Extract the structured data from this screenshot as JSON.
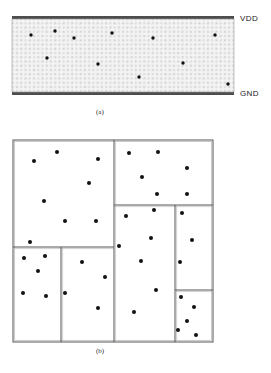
{
  "page": {
    "background_color": "#ffffff",
    "width": 271,
    "height": 373
  },
  "figure_a": {
    "caption": "(a)",
    "labels": {
      "top_rail": "VDD",
      "bottom_rail": "GND"
    },
    "region": {
      "x": 12,
      "y": 19,
      "width": 222,
      "height": 73,
      "fill_color": "#f2f2f2",
      "hatch_color": "#c9c9c9",
      "rail_color": "#4d4d4d",
      "rail_thickness": 3
    },
    "dot_color": "#111111",
    "dot_radius": 1.7,
    "dots": [
      {
        "x": 31,
        "y": 35
      },
      {
        "x": 55,
        "y": 31
      },
      {
        "x": 74,
        "y": 38
      },
      {
        "x": 112,
        "y": 33
      },
      {
        "x": 153,
        "y": 38
      },
      {
        "x": 215,
        "y": 35
      },
      {
        "x": 47,
        "y": 58
      },
      {
        "x": 98,
        "y": 64
      },
      {
        "x": 183,
        "y": 63
      },
      {
        "x": 139,
        "y": 77
      },
      {
        "x": 228,
        "y": 84
      }
    ]
  },
  "figure_b": {
    "caption": "(b)",
    "outline": {
      "x": 13,
      "y": 140,
      "width": 200,
      "height": 202,
      "stroke_color": "#555555",
      "stroke_width": 1
    },
    "partitions": [
      {
        "name": "top-left-block",
        "x": 13,
        "y": 140,
        "width": 101,
        "height": 107
      },
      {
        "name": "top-right-block",
        "x": 114,
        "y": 140,
        "width": 99,
        "height": 65
      },
      {
        "name": "center-l-block",
        "x": 13,
        "y": 247,
        "width": 162,
        "height": 95
      },
      {
        "name": "middle-center-block",
        "x": 114,
        "y": 205,
        "width": 61,
        "height": 137
      },
      {
        "name": "right-upper-block",
        "x": 175,
        "y": 205,
        "width": 38,
        "height": 85
      },
      {
        "name": "right-lower-block",
        "x": 175,
        "y": 290,
        "width": 38,
        "height": 52
      },
      {
        "name": "bottom-left-block",
        "x": 13,
        "y": 247,
        "width": 48,
        "height": 95
      }
    ],
    "dividers": [
      {
        "name": "divider-top-vertical",
        "x1": 114,
        "y1": 140,
        "x2": 114,
        "y2": 205
      },
      {
        "name": "divider-upper-horizontal",
        "x1": 114,
        "y1": 205,
        "x2": 213,
        "y2": 205
      },
      {
        "name": "divider-center-vertical",
        "x1": 114,
        "y1": 205,
        "x2": 114,
        "y2": 247
      },
      {
        "name": "divider-left-horizontal",
        "x1": 13,
        "y1": 247,
        "x2": 114,
        "y2": 247
      },
      {
        "name": "divider-center-vertical-2",
        "x1": 175,
        "y1": 205,
        "x2": 175,
        "y2": 342
      },
      {
        "name": "divider-right-horizontal",
        "x1": 175,
        "y1": 290,
        "x2": 213,
        "y2": 290
      },
      {
        "name": "divider-bottom-vertical",
        "x1": 61,
        "y1": 247,
        "x2": 61,
        "y2": 342
      },
      {
        "name": "divider-mid-vertical",
        "x1": 114,
        "y1": 247,
        "x2": 114,
        "y2": 342
      }
    ],
    "dot_color": "#111111",
    "dot_radius": 2.0,
    "dots": [
      {
        "x": 57,
        "y": 152
      },
      {
        "x": 34,
        "y": 161
      },
      {
        "x": 98,
        "y": 159
      },
      {
        "x": 89,
        "y": 183
      },
      {
        "x": 44,
        "y": 201
      },
      {
        "x": 65,
        "y": 221
      },
      {
        "x": 96,
        "y": 221
      },
      {
        "x": 30,
        "y": 242
      },
      {
        "x": 129,
        "y": 153
      },
      {
        "x": 158,
        "y": 152
      },
      {
        "x": 187,
        "y": 168
      },
      {
        "x": 142,
        "y": 177
      },
      {
        "x": 157,
        "y": 194
      },
      {
        "x": 187,
        "y": 194
      },
      {
        "x": 126,
        "y": 216
      },
      {
        "x": 154,
        "y": 210
      },
      {
        "x": 151,
        "y": 238
      },
      {
        "x": 119,
        "y": 246
      },
      {
        "x": 141,
        "y": 261
      },
      {
        "x": 82,
        "y": 262
      },
      {
        "x": 105,
        "y": 277
      },
      {
        "x": 156,
        "y": 290
      },
      {
        "x": 65,
        "y": 293
      },
      {
        "x": 98,
        "y": 308
      },
      {
        "x": 134,
        "y": 312
      },
      {
        "x": 24,
        "y": 258
      },
      {
        "x": 45,
        "y": 256
      },
      {
        "x": 38,
        "y": 271
      },
      {
        "x": 23,
        "y": 293
      },
      {
        "x": 46,
        "y": 296
      },
      {
        "x": 182,
        "y": 213
      },
      {
        "x": 192,
        "y": 240
      },
      {
        "x": 180,
        "y": 262
      },
      {
        "x": 181,
        "y": 297
      },
      {
        "x": 194,
        "y": 307
      },
      {
        "x": 187,
        "y": 321
      },
      {
        "x": 178,
        "y": 330
      },
      {
        "x": 196,
        "y": 335
      }
    ]
  }
}
